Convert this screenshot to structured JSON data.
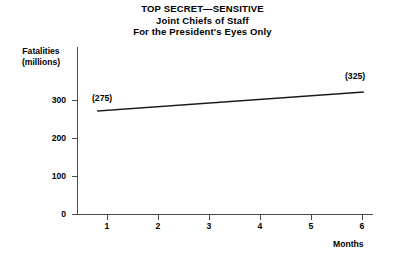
{
  "title": {
    "lines": [
      "TOP SECRET—SENSITIVE",
      "Joint Chiefs of Staff",
      "For the President's Eyes Only"
    ]
  },
  "axes": {
    "y_title_line1": "Fatalities",
    "y_title_line2": "(millions)",
    "x_title": "Months"
  },
  "annotations": {
    "start": "(275)",
    "end": "(325)"
  },
  "ticks": {
    "y": [
      "300",
      "200",
      "100",
      "0"
    ],
    "x": [
      "1",
      "2",
      "3",
      "4",
      "5",
      "6"
    ]
  },
  "colors": {
    "line": "#1a1a1a",
    "axis": "#4a4a4a",
    "text": "#000000",
    "background": "#ffffff"
  },
  "chart_data": {
    "type": "line",
    "xlabel": "Months",
    "ylabel": "Fatalities (millions)",
    "xlim": [
      0,
      6
    ],
    "ylim": [
      0,
      350
    ],
    "xticks": [
      1,
      2,
      3,
      4,
      5,
      6
    ],
    "yticks": [
      0,
      100,
      200,
      300
    ],
    "grid": false,
    "legend": false,
    "series": [
      {
        "name": "Fatalities",
        "x": [
          0.42,
          6
        ],
        "y": [
          270,
          320
        ],
        "point_labels": [
          "(275)",
          "(325)"
        ]
      }
    ]
  }
}
